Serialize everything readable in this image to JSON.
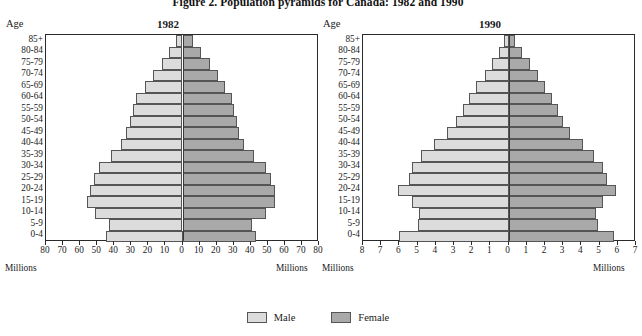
{
  "figure": {
    "title": "Figure 2. Population pyramids for Canada: 1982 and 1990"
  },
  "legend": {
    "male_label": "Male",
    "female_label": "Female",
    "male_color": "#dcdcdc",
    "female_color": "#a9a9a9"
  },
  "panels": {
    "left": {
      "subtitle": "1982",
      "age_axis_title": "Age",
      "unit_label_left": "Millions",
      "unit_label_right": "Millions"
    },
    "right": {
      "subtitle": "1990",
      "age_axis_title": "Age",
      "unit_label_left": "Millions",
      "unit_label_right": "Millions"
    }
  },
  "chart_data": [
    {
      "type": "bar",
      "title": "1982",
      "subtype": "population-pyramid",
      "xlabel": "Millions",
      "ylabel": "Age",
      "grid": false,
      "legend_position": "bottom-shared",
      "xlim": [
        -80,
        80
      ],
      "xticks": [
        80,
        70,
        60,
        50,
        40,
        30,
        20,
        10,
        0,
        10,
        20,
        30,
        40,
        50,
        60,
        70,
        80
      ],
      "categories": [
        "85+",
        "80-84",
        "75-79",
        "70-74",
        "65-69",
        "60-64",
        "55-59",
        "50-54",
        "45-49",
        "40-44",
        "35-39",
        "30-34",
        "25-29",
        "20-24",
        "15-19",
        "10-14",
        "5-9",
        "0-4"
      ],
      "series": [
        {
          "name": "Male",
          "values": [
            4,
            8,
            12,
            17,
            22,
            27,
            29,
            31,
            33,
            36,
            42,
            49,
            52,
            54,
            56,
            51,
            43,
            45
          ]
        },
        {
          "name": "Female",
          "values": [
            6,
            11,
            16,
            21,
            25,
            29,
            30,
            32,
            33,
            36,
            42,
            49,
            52,
            54,
            54,
            49,
            41,
            43
          ]
        }
      ]
    },
    {
      "type": "bar",
      "title": "1990",
      "subtype": "population-pyramid",
      "xlabel": "Millions",
      "ylabel": "Age",
      "grid": false,
      "legend_position": "bottom-shared",
      "xlim": [
        -8,
        7
      ],
      "xticks": [
        8,
        7,
        6,
        5,
        4,
        3,
        2,
        1,
        0,
        1,
        2,
        3,
        4,
        5,
        6,
        7
      ],
      "categories": [
        "85+",
        "80-84",
        "75-79",
        "70-74",
        "65-69",
        "60-64",
        "55-59",
        "50-54",
        "45-49",
        "40-44",
        "35-39",
        "30-34",
        "25-29",
        "20-24",
        "15-19",
        "10-14",
        "5-9",
        "0-4"
      ],
      "series": [
        {
          "name": "Male",
          "values": [
            0.25,
            0.55,
            0.9,
            1.3,
            1.8,
            2.2,
            2.5,
            2.9,
            3.4,
            4.1,
            4.8,
            5.3,
            5.5,
            6.1,
            5.3,
            4.9,
            5.0,
            6.0
          ]
        },
        {
          "name": "Female",
          "values": [
            0.35,
            0.75,
            1.15,
            1.6,
            2.0,
            2.4,
            2.7,
            3.0,
            3.4,
            4.1,
            4.7,
            5.2,
            5.4,
            5.9,
            5.2,
            4.8,
            4.9,
            5.8
          ]
        }
      ]
    }
  ]
}
